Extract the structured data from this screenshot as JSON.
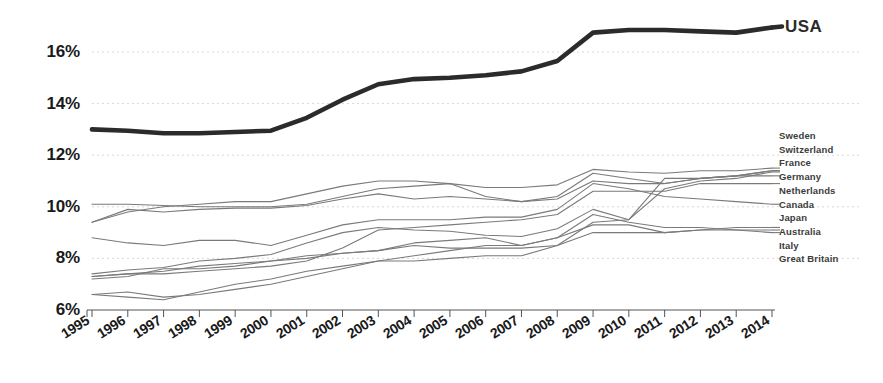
{
  "chart_data": {
    "type": "line",
    "title": "",
    "subtitle": "",
    "xlabel": "",
    "ylabel": "",
    "x": [
      1995,
      1996,
      1997,
      1998,
      1999,
      2000,
      2001,
      2002,
      2003,
      2004,
      2005,
      2006,
      2007,
      2008,
      2009,
      2010,
      2011,
      2012,
      2013,
      2014
    ],
    "xtick_labels": [
      "1995",
      "1996",
      "1997",
      "1998",
      "1999",
      "2000",
      "2001",
      "2002",
      "2003",
      "2004",
      "2005",
      "2006",
      "2007",
      "2008",
      "2009",
      "2010",
      "2011",
      "2012",
      "2013",
      "2014"
    ],
    "ytick_values": [
      6,
      8,
      10,
      12,
      14,
      16
    ],
    "ytick_labels": [
      "6%",
      "8%",
      "10%",
      "12%",
      "14%",
      "16%"
    ],
    "ylim": [
      5.7,
      17.6
    ],
    "xlim": [
      1995,
      2014
    ],
    "grid": "horizontal-dotted",
    "legend_position": "right",
    "highlight_color": "#2b2b2b",
    "series_color": "#7a7a7a",
    "series": [
      {
        "name": "USA",
        "highlight": true,
        "values": [
          13.0,
          12.95,
          12.85,
          12.85,
          12.9,
          12.95,
          13.45,
          14.15,
          14.75,
          14.95,
          15.0,
          15.1,
          15.25,
          15.65,
          16.75,
          16.85,
          16.85,
          16.8,
          16.75,
          16.95
        ]
      },
      {
        "name": "Sweden",
        "highlight": false,
        "values": [
          7.4,
          7.55,
          7.65,
          7.9,
          8.0,
          8.15,
          8.6,
          9.0,
          9.2,
          9.1,
          9.05,
          8.9,
          8.85,
          9.15,
          9.9,
          9.5,
          10.7,
          11.0,
          11.1,
          11.35
        ]
      },
      {
        "name": "Switzerland",
        "highlight": false,
        "values": [
          9.4,
          9.8,
          10.0,
          10.1,
          10.2,
          10.2,
          10.5,
          10.8,
          11.0,
          11.0,
          10.9,
          10.4,
          10.2,
          10.3,
          11.0,
          10.9,
          10.9,
          11.1,
          11.2,
          11.4
        ]
      },
      {
        "name": "France",
        "highlight": false,
        "values": [
          10.1,
          10.1,
          10.05,
          10.0,
          10.0,
          10.0,
          10.1,
          10.4,
          10.7,
          10.8,
          10.9,
          10.75,
          10.75,
          10.85,
          11.45,
          11.35,
          11.3,
          11.4,
          11.4,
          11.5
        ]
      },
      {
        "name": "Germany",
        "highlight": false,
        "values": [
          9.4,
          9.9,
          9.8,
          9.9,
          9.95,
          9.95,
          10.05,
          10.3,
          10.5,
          10.3,
          10.4,
          10.3,
          10.2,
          10.4,
          11.3,
          11.1,
          10.9,
          11.1,
          11.2,
          11.2
        ]
      },
      {
        "name": "Netherlands",
        "highlight": false,
        "values": [
          7.3,
          7.4,
          7.4,
          7.5,
          7.6,
          7.7,
          7.9,
          8.4,
          9.1,
          9.2,
          9.3,
          9.4,
          9.5,
          9.7,
          10.6,
          10.6,
          10.6,
          10.9,
          10.9,
          10.9
        ]
      },
      {
        "name": "Canada",
        "highlight": false,
        "values": [
          8.8,
          8.6,
          8.5,
          8.7,
          8.7,
          8.5,
          8.9,
          9.3,
          9.5,
          9.5,
          9.5,
          9.6,
          9.6,
          9.9,
          10.9,
          10.7,
          10.4,
          10.3,
          10.2,
          10.1
        ]
      },
      {
        "name": "Japan",
        "highlight": false,
        "values": [
          6.6,
          6.5,
          6.4,
          6.7,
          7.0,
          7.2,
          7.5,
          7.7,
          7.9,
          7.9,
          8.0,
          8.1,
          8.1,
          8.5,
          9.4,
          9.5,
          11.1,
          11.1,
          11.2,
          11.4
        ]
      },
      {
        "name": "Australia",
        "highlight": false,
        "values": [
          7.3,
          7.4,
          7.5,
          7.7,
          7.8,
          7.9,
          8.0,
          8.2,
          8.3,
          8.5,
          8.4,
          8.4,
          8.4,
          8.5,
          9.0,
          9.0,
          9.0,
          9.1,
          9.2,
          9.2
        ]
      },
      {
        "name": "Italy",
        "highlight": false,
        "values": [
          7.2,
          7.3,
          7.6,
          7.6,
          7.7,
          7.9,
          8.1,
          8.2,
          8.3,
          8.6,
          8.7,
          8.8,
          8.5,
          8.8,
          9.3,
          9.3,
          9.0,
          9.1,
          9.1,
          9.0
        ]
      },
      {
        "name": "Great Britain",
        "highlight": false,
        "values": [
          6.6,
          6.7,
          6.5,
          6.6,
          6.8,
          7.0,
          7.3,
          7.6,
          7.9,
          8.1,
          8.3,
          8.5,
          8.5,
          8.8,
          9.7,
          9.4,
          9.2,
          9.2,
          9.1,
          9.1
        ]
      }
    ]
  },
  "legend": {
    "primary": "USA",
    "items": [
      "Sweden",
      "Switzerland",
      "France",
      "Germany",
      "Netherlands",
      "Canada",
      "Japan",
      "Australia",
      "Italy",
      "Great Britain"
    ]
  }
}
